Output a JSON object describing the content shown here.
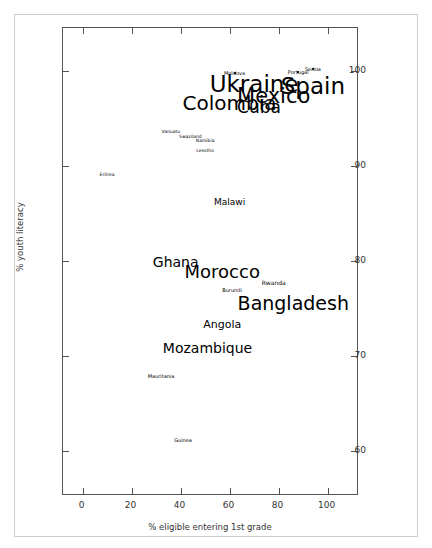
{
  "chart_data": {
    "type": "scatter",
    "title": "",
    "xlabel": "% eligible entering 1st grade",
    "ylabel": "% youth literacy",
    "xlim": [
      -8,
      112
    ],
    "ylim": [
      55.5,
      104.5
    ],
    "xticks": [
      0,
      20,
      40,
      60,
      80,
      100
    ],
    "yticks": [
      60,
      70,
      80,
      90,
      100
    ],
    "grid": false,
    "legend": null,
    "note": "Country names rendered as text labels sized by an unshown weight variable",
    "points": [
      {
        "label": "Moldova",
        "x": 62.0,
        "y": 99.8,
        "size": 5.0,
        "marker": true
      },
      {
        "label": "Portugal",
        "x": 88.0,
        "y": 99.9,
        "size": 5.0,
        "marker": true
      },
      {
        "label": "Serbia",
        "x": 94.0,
        "y": 100.2,
        "size": 5.0,
        "marker": true
      },
      {
        "label": "Ukraine",
        "x": 70.0,
        "y": 98.6,
        "size": 23.0,
        "marker": false
      },
      {
        "label": "Spain",
        "x": 94.0,
        "y": 98.4,
        "size": 23.0,
        "marker": false
      },
      {
        "label": "Mexico",
        "x": 78.0,
        "y": 97.3,
        "size": 21.0,
        "marker": false
      },
      {
        "label": "Colombia",
        "x": 60.0,
        "y": 96.6,
        "size": 20.0,
        "marker": false
      },
      {
        "label": "Cuba",
        "x": 72.0,
        "y": 96.2,
        "size": 17.0,
        "marker": false
      },
      {
        "label": "Vanuatu",
        "x": 36.0,
        "y": 93.6,
        "size": 4.5,
        "marker": false
      },
      {
        "label": "Swaziland",
        "x": 44.0,
        "y": 93.0,
        "size": 4.5,
        "marker": false
      },
      {
        "label": "Namibia",
        "x": 50.0,
        "y": 92.6,
        "size": 4.5,
        "marker": false
      },
      {
        "label": "Lesotho",
        "x": 50.0,
        "y": 91.6,
        "size": 4.5,
        "marker": false
      },
      {
        "label": "Eritrea",
        "x": 10.0,
        "y": 89.0,
        "size": 4.5,
        "marker": false
      },
      {
        "label": "Malawi",
        "x": 60.0,
        "y": 86.2,
        "size": 9.0,
        "marker": false
      },
      {
        "label": "Ghana",
        "x": 38.0,
        "y": 79.9,
        "size": 14.0,
        "marker": false
      },
      {
        "label": "Morocco",
        "x": 57.0,
        "y": 78.8,
        "size": 18.0,
        "marker": false
      },
      {
        "label": "Rwanda",
        "x": 78.0,
        "y": 77.7,
        "size": 6.0,
        "marker": false
      },
      {
        "label": "Burundi",
        "x": 61.0,
        "y": 77.0,
        "size": 5.0,
        "marker": false
      },
      {
        "label": "Bangladesh",
        "x": 86.0,
        "y": 75.6,
        "size": 19.0,
        "marker": false
      },
      {
        "label": "Angola",
        "x": 57.0,
        "y": 73.4,
        "size": 11.0,
        "marker": false
      },
      {
        "label": "Mozambique",
        "x": 51.0,
        "y": 70.9,
        "size": 14.0,
        "marker": false
      },
      {
        "label": "Mauritania",
        "x": 32.0,
        "y": 67.9,
        "size": 5.0,
        "marker": false
      },
      {
        "label": "Guinea",
        "x": 41.0,
        "y": 61.2,
        "size": 5.0,
        "marker": false
      }
    ]
  },
  "figure": {
    "background_color": "#ffffff",
    "axes_color": "#555555",
    "text_color": "#000000",
    "tick_label_color": "#333333",
    "frame_color": "#cccccc"
  }
}
